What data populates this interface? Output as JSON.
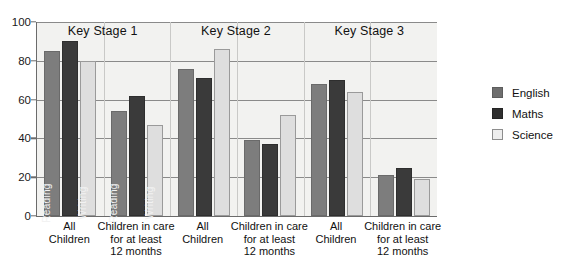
{
  "chart_data": {
    "type": "bar",
    "title": "",
    "xlabel": "",
    "ylabel": "",
    "ylim": [
      0,
      100
    ],
    "yticks": [
      0,
      20,
      40,
      60,
      80,
      100
    ],
    "grid": true,
    "legend_position": "right",
    "legend": [
      "English",
      "Maths",
      "Science"
    ],
    "stage_titles": [
      "Key Stage 1",
      "Key Stage 2",
      "Key Stage 3"
    ],
    "categories": [
      "All\nChildren",
      "Children in care\nfor at least\n12 months",
      "All\nChildren",
      "Children in care\nfor at least\n12 months",
      "All\nChildren",
      "Children in care\nfor at least\n12 months"
    ],
    "series": [
      {
        "name": "English",
        "values": [
          85,
          54,
          76,
          39,
          68,
          21
        ]
      },
      {
        "name": "Maths",
        "values": [
          90,
          62,
          71,
          37,
          70,
          25
        ]
      },
      {
        "name": "Science",
        "values": [
          80,
          47,
          86,
          52,
          64,
          19
        ]
      }
    ],
    "bar_inner_labels": [
      {
        "group": 0,
        "series": 0,
        "text": "Reading"
      },
      {
        "group": 0,
        "series": 2,
        "text": "Writing"
      },
      {
        "group": 1,
        "series": 0,
        "text": "Reading"
      },
      {
        "group": 1,
        "series": 2,
        "text": "Writing"
      }
    ],
    "colors": {
      "english": "#7d7d7d",
      "maths": "#3a3a3a",
      "science": "#dedede",
      "plot_background": "#f2f2f0",
      "gridline": "#8a8a8a",
      "axis": "#6b6b6b",
      "text": "#111111"
    }
  }
}
